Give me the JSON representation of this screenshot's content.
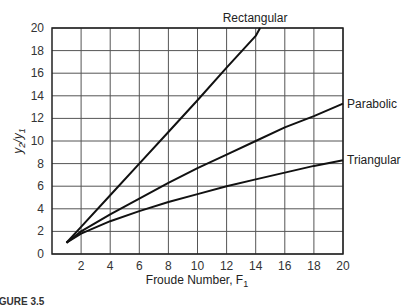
{
  "chart_data": {
    "type": "line",
    "title": "",
    "xlabel": "Froude Number, F",
    "xlabel_sub": "1",
    "ylabel_y2": "y",
    "ylabel_sub2": "2",
    "ylabel_y1": "y",
    "ylabel_sub1": "1",
    "xlim": [
      0,
      20
    ],
    "ylim": [
      0,
      20
    ],
    "x_ticks": [
      2,
      4,
      6,
      8,
      10,
      12,
      14,
      16,
      18,
      20
    ],
    "y_ticks": [
      0,
      2,
      4,
      6,
      8,
      10,
      12,
      14,
      16,
      18,
      20
    ],
    "grid": true,
    "series": [
      {
        "name": "Rectangular",
        "x": [
          1,
          2,
          4,
          6,
          8,
          10,
          12,
          14,
          14.3
        ],
        "y": [
          1.0,
          2.4,
          5.2,
          8.0,
          10.8,
          13.6,
          16.5,
          19.3,
          20
        ]
      },
      {
        "name": "Parabolic",
        "x": [
          1,
          2,
          4,
          6,
          8,
          10,
          12,
          14,
          16,
          18,
          20
        ],
        "y": [
          1.0,
          2.0,
          3.5,
          4.9,
          6.3,
          7.6,
          8.8,
          10.0,
          11.2,
          12.2,
          13.3
        ]
      },
      {
        "name": "Triangular",
        "x": [
          1,
          2,
          4,
          6,
          8,
          10,
          12,
          14,
          16,
          18,
          20
        ],
        "y": [
          1.0,
          1.8,
          2.9,
          3.8,
          4.6,
          5.3,
          6.0,
          6.6,
          7.2,
          7.8,
          8.3
        ]
      }
    ]
  },
  "caption": "IGURE 3.5"
}
